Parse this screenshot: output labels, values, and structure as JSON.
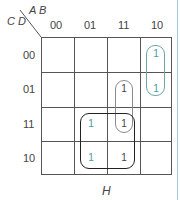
{
  "kmap": {
    "row_var": "C D",
    "col_var": "A B",
    "col_headers": [
      "00",
      "01",
      "11",
      "10"
    ],
    "row_headers": [
      "00",
      "01",
      "11",
      "10"
    ],
    "cells": [
      [
        "",
        "",
        "",
        "1"
      ],
      [
        "",
        "",
        "1",
        "1"
      ],
      [
        "",
        "1",
        "1",
        ""
      ],
      [
        "",
        "1",
        "1",
        ""
      ]
    ],
    "groups": [
      {
        "name": "group-col10-rows00-01",
        "color": "#6aa8a8"
      },
      {
        "name": "group-col11-rows01-11",
        "color": "#888888"
      },
      {
        "name": "group-quad-H",
        "color": "#222222"
      }
    ],
    "annotation": "H"
  },
  "colors": {
    "grid": "#555555",
    "teal_one": "#4a9a9a",
    "dark_one": "#444444",
    "side_line": "#9ec9d8"
  }
}
